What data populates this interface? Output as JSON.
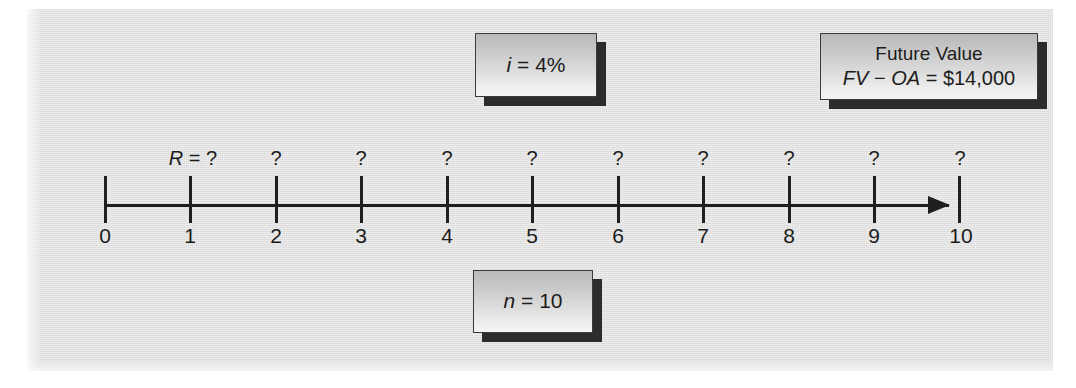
{
  "figure": {
    "background_color": "#e3e3e3",
    "ink_color": "#1f1f1f"
  },
  "callouts": {
    "interest": {
      "text": "i = 4%",
      "symbol": "i",
      "operator": "=",
      "value": "4%"
    },
    "periods": {
      "text": "n = 10",
      "symbol": "n",
      "operator": "=",
      "value": "10"
    },
    "future_value": {
      "heading": "Future Value",
      "formula": "FV − OA = $14,000",
      "formula_symbol_1": "FV",
      "formula_operator_1": "−",
      "formula_symbol_2": "OA",
      "formula_operator_2": "=",
      "formula_value": "$14,000"
    }
  },
  "timeline": {
    "axis_start_label": "0",
    "axis_end_label": "10",
    "tick_numbers": [
      "0",
      "1",
      "2",
      "3",
      "4",
      "5",
      "6",
      "7",
      "8",
      "9",
      "10"
    ],
    "tick_x": [
      104,
      189,
      275,
      360,
      446,
      531,
      617,
      702,
      788,
      873,
      958
    ],
    "rent_label": "R = ?",
    "rent_symbol": "R",
    "rent_operator": "=",
    "rent_value": "?",
    "flow_labels": [
      "R = ?",
      "?",
      "?",
      "?",
      "?",
      "?",
      "?",
      "?",
      "?",
      "?"
    ],
    "flow_label_x": [
      189,
      275,
      360,
      446,
      531,
      617,
      702,
      788,
      873,
      958
    ],
    "arrow_direction": "right"
  }
}
